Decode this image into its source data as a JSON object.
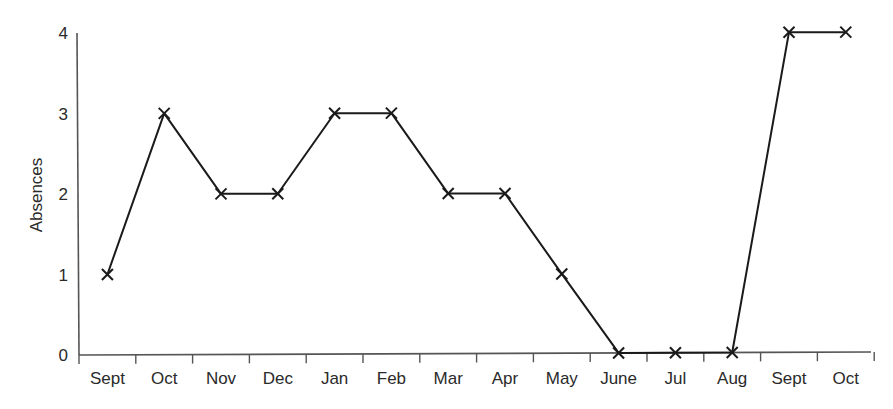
{
  "chart_data": {
    "type": "line",
    "title": "",
    "xlabel": "",
    "ylabel": "Absences",
    "categories": [
      "Sept",
      "Oct",
      "Nov",
      "Dec",
      "Jan",
      "Feb",
      "Mar",
      "Apr",
      "May",
      "June",
      "Jul",
      "Aug",
      "Sept",
      "Oct"
    ],
    "series": [
      {
        "name": "Absences",
        "values": [
          1,
          3,
          2,
          2,
          3,
          3,
          2,
          2,
          1,
          0,
          0,
          0,
          4,
          4
        ],
        "marker": "x",
        "color": "#1a1a1a"
      }
    ],
    "yticks": [
      0,
      1,
      2,
      3,
      4
    ],
    "ylim": [
      0,
      4
    ],
    "grid": false,
    "legend": null
  },
  "colors": {
    "line": "#1a1a1a",
    "axis": "#555555",
    "text": "#2a2a2a",
    "background": "#ffffff"
  }
}
